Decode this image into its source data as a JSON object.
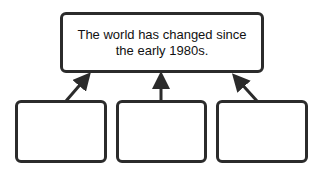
{
  "diagram": {
    "top_box": {
      "text": "The world has changed since the early 1980s."
    },
    "bottom_boxes": [
      {
        "text": ""
      },
      {
        "text": ""
      },
      {
        "text": ""
      }
    ],
    "colors": {
      "stroke": "#2b2b2b",
      "background": "#ffffff"
    }
  }
}
